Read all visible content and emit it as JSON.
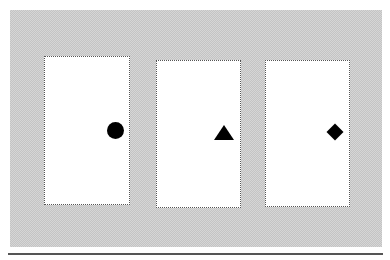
{
  "cards": [
    {
      "id": "card-1",
      "symbol": "circle",
      "icon": "circle-icon",
      "color": "#000000"
    },
    {
      "id": "card-2",
      "symbol": "triangle",
      "icon": "triangle-icon",
      "color": "#000000"
    },
    {
      "id": "card-3",
      "symbol": "diamond",
      "icon": "diamond-icon",
      "color": "#000000"
    }
  ],
  "colors": {
    "background": "#ffffff",
    "panel": "#d0d0d0",
    "card": "#ffffff",
    "divider": "#555555"
  }
}
